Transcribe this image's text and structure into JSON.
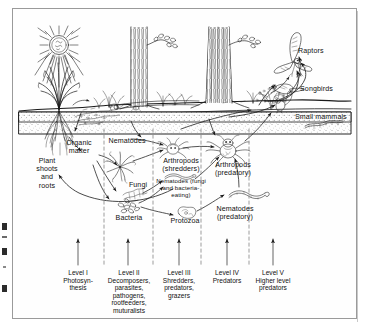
{
  "figure": {
    "type": "diagram",
    "background_color": "#ffffff",
    "frame_color": "#9a9a9a",
    "ink_color": "#1a1a1a"
  },
  "above_ground_labels": [
    {
      "name": "raptors",
      "text": "Raptors"
    },
    {
      "name": "songbirds",
      "text": "Songbirds"
    },
    {
      "name": "small-mammals",
      "text": "Small mammals"
    }
  ],
  "organism_labels": [
    {
      "name": "plant-shoots-and-roots",
      "text": "Plant\nshoots\nand\nroots"
    },
    {
      "name": "organic-matter",
      "text": "Organic\nmatter"
    },
    {
      "name": "nematodes",
      "text": "Nematodes"
    },
    {
      "name": "fungi",
      "text": "Fungi"
    },
    {
      "name": "bacteria",
      "text": "Bacteria"
    },
    {
      "name": "arthropods-shredders",
      "text": "Arthropods\n(shredders)"
    },
    {
      "name": "nematodes-fungi-and-bacteria-eating",
      "text": "Nematodes (fungi\nand bacteria-\neating)"
    },
    {
      "name": "protozoa",
      "text": "Protozoa"
    },
    {
      "name": "arthropods-predatory",
      "text": "Arthropods\n(predatory)"
    },
    {
      "name": "nematodes-predatory",
      "text": "Nematodes\n(predatory)"
    }
  ],
  "trophic_levels": [
    {
      "name": "level-1",
      "text": "Level I\nPhotosyn-\nthesis"
    },
    {
      "name": "level-2",
      "text": "Level II\nDecomposers,\nparasites,\npathogens,\nrootfeeders,\nmuturalists"
    },
    {
      "name": "level-3",
      "text": "Level III\nShredders,\npredators,\ngrazers"
    },
    {
      "name": "level-4",
      "text": "Level IV\nPredators"
    },
    {
      "name": "level-5",
      "text": "Level V\nHigher level\npredators"
    }
  ]
}
